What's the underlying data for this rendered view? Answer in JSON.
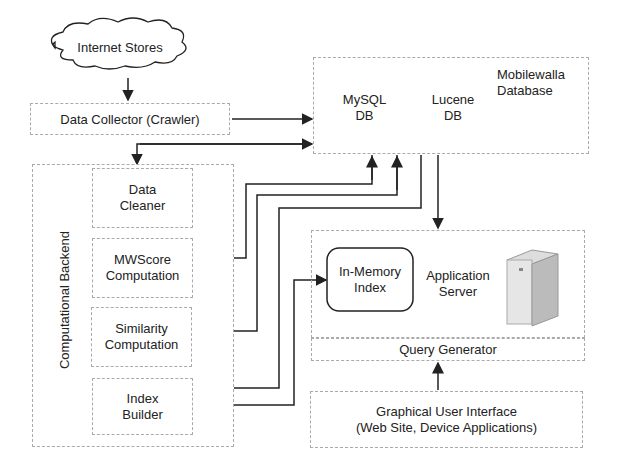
{
  "nodes": {
    "internet_stores": "Internet Stores",
    "data_collector": "Data Collector (Crawler)",
    "database": {
      "label_line1": "Mobilewalla",
      "label_line2": "Database",
      "mysql": {
        "line1": "MySQL",
        "line2": "DB"
      },
      "lucene": {
        "line1": "Lucene",
        "line2": "DB"
      }
    },
    "backend": {
      "label": "Computational Backend",
      "data_cleaner": {
        "line1": "Data",
        "line2": "Cleaner"
      },
      "mwscore": {
        "line1": "MWScore",
        "line2": "Computation"
      },
      "similarity": {
        "line1": "Similarity",
        "line2": "Computation"
      },
      "index_builder": {
        "line1": "Index",
        "line2": "Builder"
      }
    },
    "app_server": {
      "label_line1": "Application",
      "label_line2": "Server",
      "in_memory": {
        "line1": "In-Memory",
        "line2": "Index"
      },
      "query_generator": "Query Generator"
    },
    "gui": {
      "line1": "Graphical User Interface",
      "line2": "(Web Site, Device Applications)"
    }
  },
  "server_icon": "server-tower-icon"
}
